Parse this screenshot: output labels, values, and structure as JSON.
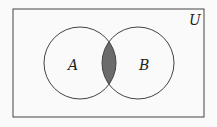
{
  "diagram": {
    "type": "venn",
    "universe_label": "U",
    "sets": [
      {
        "label": "A"
      },
      {
        "label": "B"
      }
    ],
    "shaded_region": "A ∩ B",
    "colors": {
      "stroke": "#333333",
      "shade": "#6b6b6b",
      "background": "#fafafa"
    }
  }
}
